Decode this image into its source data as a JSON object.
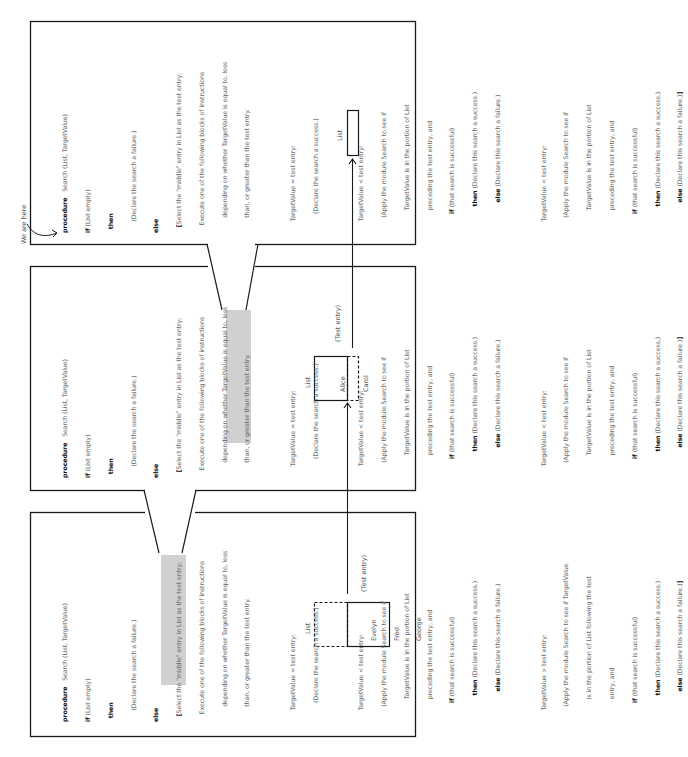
{
  "annotation": {
    "we_are_here": "We are here"
  },
  "procedure": {
    "keyword_procedure": "procedure",
    "signature": "Search (List, TargetValue)",
    "kw_if": "if",
    "kw_then": "then",
    "kw_else": "else",
    "if_cond": "(List empty)",
    "then_body": "(Declare the search a failure.)",
    "else_open_bracket": "[",
    "else_lines": [
      "Select the \"middle\" entry in List as the test entry;",
      "Execute one of the following blocks of instructions",
      "depending on whether TargetValue is equal to, less",
      "than, or greater than the test entry."
    ],
    "case_equal": {
      "cond": "TargetValue = test entry:",
      "body": "(Declare the search a success.)"
    },
    "case_less": {
      "cond": "TargetValue < test entry:",
      "apply_lines": [
        "(Apply the module Search to see if",
        "TargetValue is in the portion of List",
        "preceding the test entry, and"
      ],
      "if_text": "(that search is successful)",
      "then_text": "(Declare this search a success.)",
      "else_text": "(Declare this search a failure.)"
    },
    "case_greater": {
      "cond": "TargetValue > test entry:",
      "apply_lines": [
        "(Apply the module Search to see if TargetValue",
        "is in the portion of List following the test",
        "entry, and"
      ],
      "if_text": "(that search is successful)",
      "then_text": "(Declare this search a success.)",
      "else_text": "(Declare this search a failure.)",
      "close": "]"
    }
  },
  "panels": [
    {
      "id": "top",
      "position": "innermost-call",
      "list_label": "List",
      "list_entries": [],
      "test_entry_label": ""
    },
    {
      "id": "middle",
      "position": "second-call",
      "list_label": "List",
      "list_entries": [
        "Alice",
        "Carol"
      ],
      "test_entry_label": "(Test entry)"
    },
    {
      "id": "bottom",
      "position": "first-call",
      "list_label": "List",
      "list_entries": [
        "Evelyn",
        "Fred",
        "George"
      ],
      "test_entry_label": "(Test entry)"
    }
  ],
  "colors": {
    "border": "#1a1a1a",
    "highlight": "#d0d0d0",
    "text": "#6a6a6a",
    "keyword": "#111111"
  }
}
